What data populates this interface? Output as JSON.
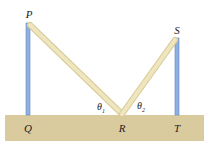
{
  "diagram": {
    "labels": {
      "P": "P",
      "S": "S",
      "Q": "Q",
      "R": "R",
      "T": "T",
      "theta1": "θ",
      "theta1_sub": "1",
      "theta2": "θ",
      "theta2_sub": "2"
    },
    "colors": {
      "ground": "#d9cb9e",
      "pole": "#8fb1e0",
      "pole_edge": "#5f86c4",
      "rope": "#ede3b8",
      "rope_edge": "#d8cb95"
    }
  }
}
